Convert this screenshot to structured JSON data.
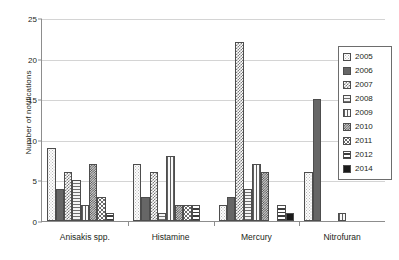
{
  "chart_data": {
    "type": "bar",
    "title": "",
    "subtitle": "",
    "xlabel": "",
    "ylabel": "Number of notifications",
    "ylim": [
      0,
      25
    ],
    "y_ticks": [
      0,
      5,
      10,
      15,
      20,
      25
    ],
    "grid": true,
    "legend_position": "right",
    "categories": [
      "Anisakis spp.",
      "Histamine",
      "Mercury",
      "Nitrofuran"
    ],
    "series": [
      {
        "name": "2005",
        "pattern": "sparse-dots-light",
        "values": [
          9,
          7,
          2,
          6
        ]
      },
      {
        "name": "2006",
        "pattern": "solid-dark-grey",
        "values": [
          4,
          3,
          3,
          15
        ]
      },
      {
        "name": "2007",
        "pattern": "checker-medium",
        "values": [
          6,
          6,
          22,
          0
        ]
      },
      {
        "name": "2008",
        "pattern": "horizontal-lines",
        "values": [
          5,
          1,
          4,
          0
        ]
      },
      {
        "name": "2009",
        "pattern": "vertical-lines",
        "values": [
          2,
          8,
          7,
          1
        ]
      },
      {
        "name": "2010",
        "pattern": "checker-dense-dark",
        "values": [
          7,
          2,
          6,
          0
        ]
      },
      {
        "name": "2011",
        "pattern": "scattered-dots",
        "values": [
          3,
          2,
          0,
          0
        ]
      },
      {
        "name": "2012",
        "pattern": "horizontal-bands",
        "values": [
          1,
          2,
          2,
          0
        ]
      },
      {
        "name": "2014",
        "pattern": "solid-black",
        "values": [
          0,
          0,
          1,
          0
        ]
      }
    ]
  },
  "legend": {
    "entries": [
      "2005",
      "2006",
      "2007",
      "2008",
      "2009",
      "2010",
      "2011",
      "2012",
      "2014"
    ]
  },
  "colors": {
    "axis": "#8d8d8d",
    "gridline": "#d4d4d4",
    "text": "#231f20",
    "bar_outline": "#4d4d4d",
    "background": "#ffffff"
  }
}
